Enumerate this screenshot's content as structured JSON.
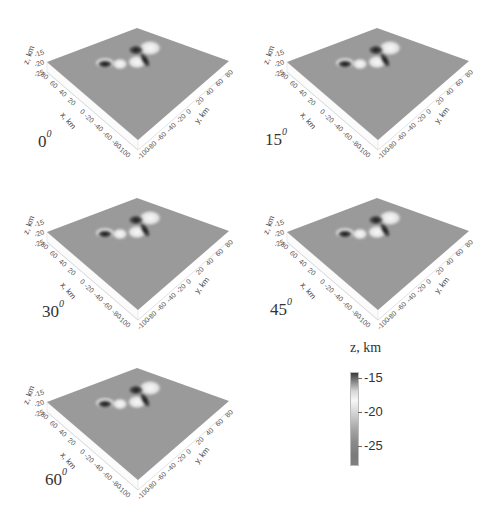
{
  "figure": {
    "panels": [
      {
        "angle": "0",
        "sup": "0"
      },
      {
        "angle": "15",
        "sup": "0"
      },
      {
        "angle": "30",
        "sup": "0"
      },
      {
        "angle": "45",
        "sup": "0"
      },
      {
        "angle": "60",
        "sup": "0"
      }
    ],
    "axes": {
      "x_label": "x, km",
      "y_label": "y, km",
      "z_label": "z, km",
      "x_ticks": [
        "80",
        "60",
        "40",
        "20",
        "0",
        "-20",
        "-40",
        "-60",
        "-80",
        "-100"
      ],
      "y_ticks": [
        "-100",
        "-80",
        "-60",
        "-40",
        "-20",
        "0",
        "20",
        "40",
        "60",
        "80"
      ],
      "z_ticks": [
        "-15",
        "-20",
        "-25"
      ]
    },
    "colorbar": {
      "title": "z, km",
      "ticks": [
        "-15",
        "-20",
        "-25"
      ]
    }
  },
  "chart_data": {
    "type": "heatmap",
    "subtype": "3d-surface",
    "title": "",
    "panels": [
      "0°",
      "15°",
      "30°",
      "45°",
      "60°"
    ],
    "xlabel": "x, km",
    "ylabel": "y, km",
    "zlabel": "z, km",
    "x_ticks": [
      80,
      60,
      40,
      20,
      0,
      -20,
      -40,
      -60,
      -80,
      -100
    ],
    "y_ticks": [
      -100,
      -80,
      -60,
      -40,
      -20,
      0,
      20,
      40,
      60,
      80
    ],
    "z_ticks": [
      -15,
      -20,
      -25
    ],
    "xlim": [
      -100,
      100
    ],
    "ylim": [
      -100,
      100
    ],
    "zlim": [
      -28,
      -14
    ],
    "colorbar": {
      "label": "z, km",
      "ticks": [
        -15,
        -20,
        -25
      ],
      "colormap": "grayscale (dark at -15, light near -19, gray to -28)"
    },
    "legend_position": "bottom-right"
  }
}
